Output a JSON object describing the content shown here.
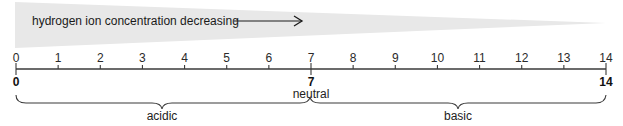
{
  "gradient": {
    "label": "hydrogen ion concentration decreasing",
    "arrow": "right-arrow",
    "fill_color": "#e8e8e8"
  },
  "scale": {
    "min": 0,
    "max": 14,
    "ticks": [
      "0",
      "1",
      "2",
      "3",
      "4",
      "5",
      "6",
      "7",
      "8",
      "9",
      "10",
      "11",
      "12",
      "13",
      "14"
    ],
    "bold_markers": [
      {
        "value": "0",
        "label": ""
      },
      {
        "value": "7",
        "label": "neutral"
      },
      {
        "value": "14",
        "label": ""
      }
    ]
  },
  "regions": [
    {
      "name": "acidic",
      "from": 0,
      "to": 7
    },
    {
      "name": "basic",
      "from": 7,
      "to": 14
    }
  ],
  "colors": {
    "line": "#3a3a3a",
    "wedge": "#e8e8e8"
  }
}
